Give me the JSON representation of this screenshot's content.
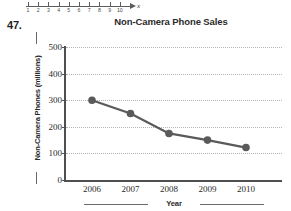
{
  "problem": {
    "number": "47."
  },
  "number_line": {
    "axis_label": "x",
    "ticks": [
      "1",
      "2",
      "3",
      "4",
      "5",
      "6",
      "7",
      "8",
      "9",
      "10"
    ]
  },
  "chart_data": {
    "type": "line",
    "title": "Non-Camera Phone Sales",
    "xlabel": "Year",
    "ylabel": "Non-Camera Phones (millions)",
    "categories": [
      "2006",
      "2007",
      "2008",
      "2009",
      "2010"
    ],
    "values": [
      300,
      250,
      175,
      150,
      122
    ],
    "ylim": [
      0,
      500
    ],
    "ytick_labels": [
      "0",
      "100",
      "200",
      "300",
      "400",
      "500"
    ],
    "ytick_values": [
      0,
      100,
      200,
      300,
      400,
      500
    ],
    "grid": "horizontal-dotted",
    "legend": "none",
    "series_color": "#5a5a5a",
    "marker": "circle",
    "grid_color": "#b4b4b4",
    "axis_color": "#4f4f4f"
  }
}
